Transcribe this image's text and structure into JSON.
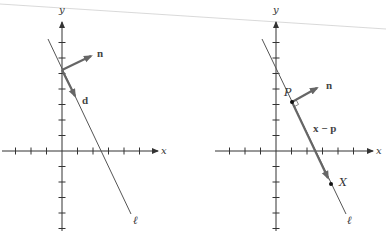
{
  "figures": [
    {
      "name": "left",
      "axis_labels": {
        "x": "x",
        "y": "y"
      },
      "line_label": "ℓ",
      "vectors": [
        {
          "label": "n",
          "meaning": "normal vector"
        },
        {
          "label": "d",
          "meaning": "direction vector"
        }
      ]
    },
    {
      "name": "right",
      "axis_labels": {
        "x": "x",
        "y": "y"
      },
      "line_label": "ℓ",
      "points": [
        {
          "label": "P"
        },
        {
          "label": "X"
        }
      ],
      "vectors": [
        {
          "label": "n",
          "meaning": "normal vector"
        },
        {
          "label": "x − p",
          "meaning": "vector from P to X"
        }
      ]
    }
  ],
  "colors": {
    "axis": "#333333",
    "vector": "#666666",
    "line": "#555555",
    "background": "#ffffff",
    "top_rule": "#cccccc"
  }
}
